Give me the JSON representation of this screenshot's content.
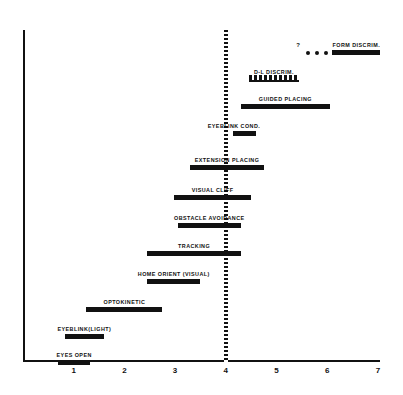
{
  "chart_data": {
    "type": "bar",
    "title": "",
    "subtitle": "",
    "xlabel": "",
    "ylabel": "",
    "xlim": [
      0,
      7.35
    ],
    "xticks": [
      1,
      2,
      3,
      4,
      5,
      6,
      7
    ],
    "xtick_labels": [
      "1",
      "2",
      "3",
      "4",
      "5",
      "6",
      "7"
    ],
    "grid": false,
    "legend": "none",
    "orientation": "horizontal-range-bars",
    "annotations": [
      {
        "name": "reference-line",
        "x": 4,
        "style": "dashed-vertical"
      },
      {
        "name": "uncertainty-marker",
        "label": "?",
        "applies_to": "FORM DISCRIM."
      }
    ],
    "categories": [
      "FORM DISCRIM.",
      "D-L DISCRIM.",
      "GUIDED PLACING",
      "EYEBLINK  COND.",
      "EXTENSION PLACING",
      "VISUAL CLIFF",
      "OBSTACLE AVOIDANCE",
      "TRACKING",
      "HOME ORIENT (VISUAL)",
      "OPTOKINETIC",
      "EYEBLINK(LIGHT)",
      "EYES OPEN"
    ],
    "bars": [
      {
        "label": "FORM DISCRIM.",
        "start": 6.1,
        "end": 7.05,
        "style": "solid",
        "lead_dots": 3,
        "query": true,
        "label_align": "center"
      },
      {
        "label": "D-L DISCRIM.",
        "start": 4.45,
        "end": 5.45,
        "style": "dashed",
        "lead_dots": 0,
        "query": false,
        "label_align": "center"
      },
      {
        "label": "GUIDED PLACING",
        "start": 4.3,
        "end": 6.05,
        "style": "solid",
        "lead_dots": 0,
        "query": false,
        "label_align": "center"
      },
      {
        "label": "EYEBLINK  COND.",
        "start": 4.15,
        "end": 4.6,
        "style": "solid",
        "lead_dots": 0,
        "query": false,
        "label_align": "rightish"
      },
      {
        "label": "EXTENSION PLACING",
        "start": 3.3,
        "end": 4.75,
        "style": "solid",
        "lead_dots": 0,
        "query": false,
        "label_align": "center"
      },
      {
        "label": "VISUAL CLIFF",
        "start": 2.98,
        "end": 4.5,
        "style": "solid",
        "lead_dots": 0,
        "query": false,
        "label_align": "center"
      },
      {
        "label": "OBSTACLE AVOIDANCE",
        "start": 3.05,
        "end": 4.3,
        "style": "solid",
        "lead_dots": 0,
        "query": false,
        "label_align": "center"
      },
      {
        "label": "TRACKING",
        "start": 2.45,
        "end": 4.3,
        "style": "solid",
        "lead_dots": 0,
        "query": false,
        "label_align": "center"
      },
      {
        "label": "HOME ORIENT (VISUAL)",
        "start": 2.45,
        "end": 3.5,
        "style": "solid",
        "lead_dots": 0,
        "query": false,
        "label_align": "center"
      },
      {
        "label": "OPTOKINETIC",
        "start": 1.25,
        "end": 2.75,
        "style": "solid",
        "lead_dots": 0,
        "query": false,
        "label_align": "center"
      },
      {
        "label": "EYEBLINK(LIGHT)",
        "start": 0.82,
        "end": 1.6,
        "style": "solid",
        "lead_dots": 0,
        "query": false,
        "label_align": "center"
      },
      {
        "label": "EYES OPEN",
        "start": 0.7,
        "end": 1.32,
        "style": "solid",
        "lead_dots": 0,
        "query": false,
        "label_align": "center"
      }
    ],
    "bar_rows_y": [
      43,
      70,
      97,
      124,
      158,
      188,
      216,
      244,
      272,
      300,
      327,
      353
    ]
  },
  "colors": {
    "ink": "#111111",
    "background": "#ffffff"
  }
}
